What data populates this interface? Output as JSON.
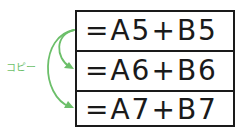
{
  "diagram": {
    "label": "コピー",
    "accent_color": "#6cbf6a",
    "cells": [
      {
        "formula": "=A5+B5"
      },
      {
        "formula": "=A6+B6"
      },
      {
        "formula": "=A7+B7"
      }
    ]
  }
}
